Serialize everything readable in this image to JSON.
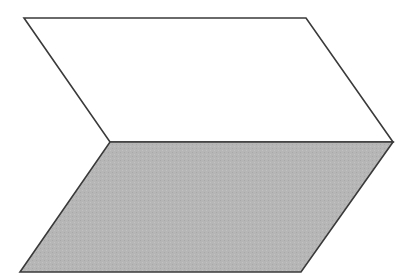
{
  "diagram": {
    "canvas": {
      "width": 412,
      "height": 280,
      "background": "#ffffff"
    },
    "stroke_color": "#3a3a3a",
    "shapes": [
      {
        "name": "upper-parallelogram",
        "fill": "#ffffff",
        "points": [
          [
            24,
            18
          ],
          [
            306,
            18
          ],
          [
            393,
            142
          ],
          [
            110,
            142
          ]
        ]
      },
      {
        "name": "lower-parallelogram",
        "fill": "#b4b4b4",
        "points": [
          [
            110,
            142
          ],
          [
            393,
            142
          ],
          [
            301,
            272
          ],
          [
            20,
            272
          ]
        ]
      }
    ],
    "labels": []
  }
}
